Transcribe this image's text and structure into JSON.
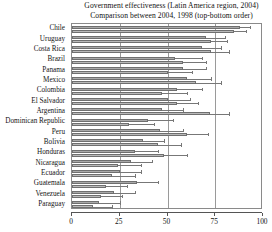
{
  "chart": {
    "title_lines": [
      "Government effectiveness (Latin America region, 2004)",
      "Comparison between 2004, 1998 (top-bottom order)"
    ]
  },
  "axis": {
    "ticks": [
      {
        "label": "0",
        "value": 0
      },
      {
        "label": "25",
        "value": 25
      },
      {
        "label": "50",
        "value": 50
      },
      {
        "label": "75",
        "value": 75
      },
      {
        "label": "100",
        "value": 100
      }
    ]
  },
  "chart_data": {
    "type": "bar",
    "orientation": "horizontal",
    "title": "Government effectiveness (Latin America region, 2004)",
    "subtitle": "Comparison between 2004, 1998 (top-bottom order)",
    "xlabel": "",
    "ylabel": "",
    "xlim": [
      0,
      100
    ],
    "xticks": [
      0,
      25,
      50,
      75,
      100
    ],
    "grid": true,
    "legend": "none",
    "bar_order_note": "For each country the upper bar is 2004 and the lower bar is 1998",
    "error_bars": "horizontal 90% confidence intervals drawn to the right of each bar",
    "categories": [
      "Chile",
      "Uruguay",
      "Costa Rica",
      "Brazil",
      "Panama",
      "Mexico",
      "Colombia",
      "El Salvador",
      "Argentina",
      "Dominican Republic",
      "Peru",
      "Bolivia",
      "Honduras",
      "Nicaragua",
      "Ecuador",
      "Guatemala",
      "Venezuela",
      "Paraguay"
    ],
    "series": [
      {
        "name": "2004",
        "values": [
          88,
          70,
          68,
          54,
          58,
          60,
          55,
          50,
          47,
          40,
          46,
          37,
          33,
          31,
          25,
          34,
          22,
          14
        ],
        "error_high": [
          93,
          80,
          78,
          68,
          70,
          73,
          68,
          62,
          58,
          53,
          58,
          48,
          45,
          42,
          36,
          45,
          33,
          25
        ]
      },
      {
        "name": "1998",
        "values": [
          85,
          73,
          73,
          58,
          50,
          65,
          47,
          55,
          72,
          30,
          60,
          45,
          48,
          24,
          21,
          18,
          15,
          11
        ],
        "error_high": [
          91,
          81,
          82,
          70,
          63,
          78,
          60,
          66,
          82,
          43,
          71,
          57,
          60,
          36,
          33,
          29,
          26,
          21
        ]
      }
    ]
  }
}
